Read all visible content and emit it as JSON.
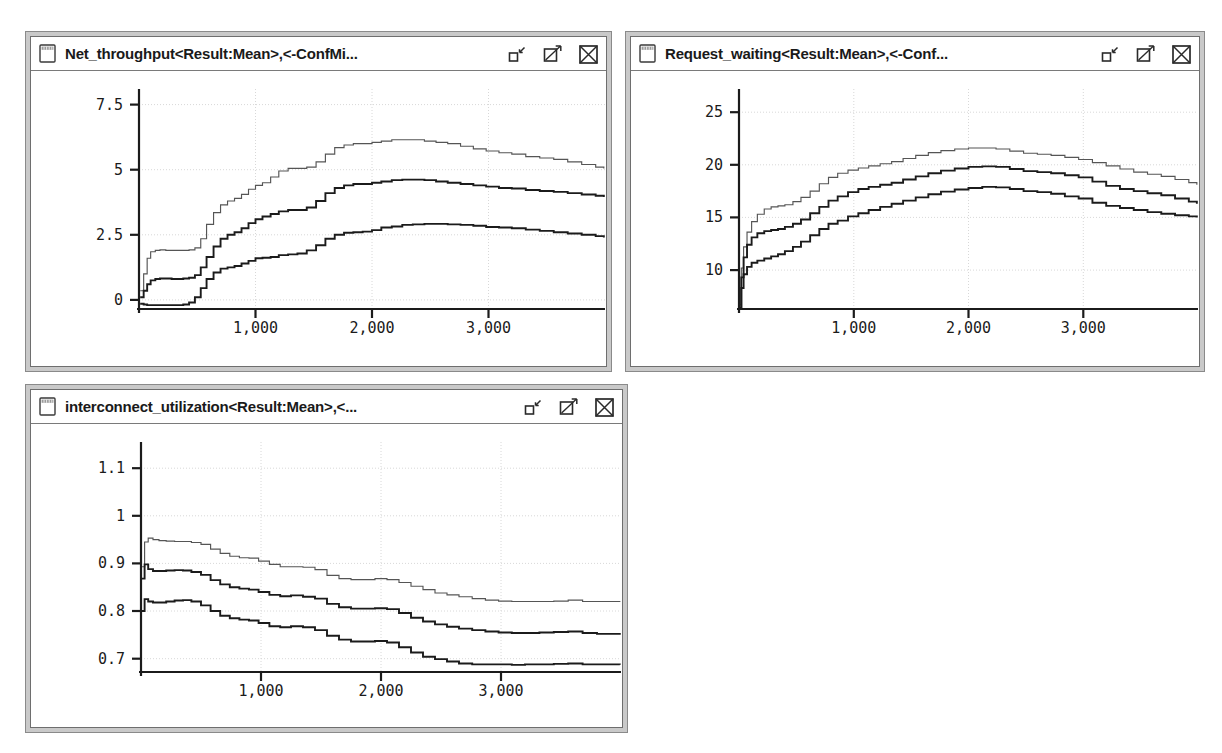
{
  "app": {
    "background": "#ffffff",
    "chrome_color": "#c9c9c9",
    "border_color": "#6e6e6e",
    "line_color": "#1b1b1b",
    "grid_color": "#d8d8d8"
  },
  "windows": [
    {
      "id": "net-throughput",
      "title": "Net_throughput<Result:Mean>,<-ConfMi...",
      "icon": "window-icon",
      "controls": [
        {
          "name": "minimize-button",
          "label": "minimize"
        },
        {
          "name": "maximize-button",
          "label": "maximize"
        },
        {
          "name": "close-button",
          "label": "close"
        }
      ]
    },
    {
      "id": "request-waiting",
      "title": "Request_waiting<Result:Mean>,<-Conf...",
      "icon": "window-icon",
      "controls": [
        {
          "name": "minimize-button",
          "label": "minimize"
        },
        {
          "name": "maximize-button",
          "label": "maximize"
        },
        {
          "name": "close-button",
          "label": "close"
        }
      ]
    },
    {
      "id": "interconnect-utilization",
      "title": "interconnect_utilization<Result:Mean>,<...",
      "icon": "window-icon",
      "controls": [
        {
          "name": "minimize-button",
          "label": "minimize"
        },
        {
          "name": "maximize-button",
          "label": "maximize"
        },
        {
          "name": "close-button",
          "label": "close"
        }
      ]
    }
  ],
  "chart_data": [
    {
      "id": "net-throughput",
      "type": "line",
      "title": "Net_throughput<Result:Mean>,<-ConfMi...",
      "xlabel": "",
      "ylabel": "",
      "grid": true,
      "legend": "none",
      "xlim": [
        0,
        4000
      ],
      "ylim": [
        -0.35,
        8.1
      ],
      "xticks": [
        1000,
        2000,
        3000
      ],
      "xticklabels": [
        "1,000",
        "2,000",
        "3,000"
      ],
      "yticks": [
        0,
        2.5,
        5,
        7.5
      ],
      "yticklabels": [
        "0",
        "2.5",
        "5",
        "7.5"
      ],
      "series": [
        {
          "name": "ConfMax",
          "x": [
            10,
            40,
            70,
            100,
            140,
            180,
            230,
            280,
            330,
            380,
            430,
            480,
            530,
            580,
            640,
            700,
            760,
            820,
            880,
            940,
            1000,
            1060,
            1130,
            1200,
            1280,
            1360,
            1440,
            1520,
            1600,
            1680,
            1760,
            1840,
            1920,
            2000,
            2080,
            2170,
            2260,
            2350,
            2450,
            2550,
            2650,
            2760,
            2870,
            2980,
            3090,
            3200,
            3320,
            3440,
            3560,
            3680,
            3800,
            3920,
            3990
          ],
          "y": [
            0.35,
            1.0,
            1.6,
            1.85,
            1.9,
            1.92,
            1.9,
            1.9,
            1.9,
            1.9,
            1.92,
            2.0,
            2.35,
            2.9,
            3.35,
            3.65,
            3.8,
            3.9,
            4.05,
            4.25,
            4.4,
            4.5,
            4.72,
            4.95,
            5.05,
            5.05,
            5.1,
            5.3,
            5.6,
            5.85,
            5.95,
            6.0,
            6.0,
            6.05,
            6.1,
            6.15,
            6.15,
            6.15,
            6.1,
            6.05,
            6.0,
            5.9,
            5.8,
            5.72,
            5.65,
            5.6,
            5.5,
            5.45,
            5.4,
            5.3,
            5.2,
            5.1,
            5.05
          ]
        },
        {
          "name": "Mean",
          "x": [
            10,
            40,
            70,
            100,
            140,
            180,
            230,
            280,
            330,
            380,
            430,
            480,
            530,
            580,
            640,
            700,
            760,
            820,
            880,
            940,
            1000,
            1060,
            1130,
            1200,
            1280,
            1360,
            1440,
            1520,
            1600,
            1680,
            1760,
            1840,
            1920,
            2000,
            2080,
            2170,
            2260,
            2350,
            2450,
            2550,
            2650,
            2760,
            2870,
            2980,
            3090,
            3200,
            3320,
            3440,
            3560,
            3680,
            3800,
            3920,
            3990
          ],
          "y": [
            0.1,
            0.35,
            0.6,
            0.75,
            0.8,
            0.82,
            0.82,
            0.8,
            0.8,
            0.82,
            0.85,
            0.95,
            1.25,
            1.65,
            2.05,
            2.35,
            2.5,
            2.6,
            2.75,
            2.95,
            3.1,
            3.2,
            3.3,
            3.4,
            3.45,
            3.45,
            3.55,
            3.8,
            4.1,
            4.3,
            4.4,
            4.45,
            4.45,
            4.5,
            4.55,
            4.6,
            4.62,
            4.62,
            4.6,
            4.55,
            4.5,
            4.45,
            4.4,
            4.35,
            4.3,
            4.28,
            4.22,
            4.18,
            4.15,
            4.1,
            4.05,
            4.0,
            3.95
          ]
        },
        {
          "name": "ConfMin",
          "x": [
            10,
            40,
            70,
            100,
            140,
            180,
            230,
            280,
            330,
            380,
            430,
            480,
            530,
            580,
            640,
            700,
            760,
            820,
            880,
            940,
            1000,
            1060,
            1130,
            1200,
            1280,
            1360,
            1440,
            1520,
            1600,
            1680,
            1760,
            1840,
            1920,
            2000,
            2080,
            2170,
            2260,
            2350,
            2450,
            2550,
            2650,
            2760,
            2870,
            2980,
            3090,
            3200,
            3320,
            3440,
            3560,
            3680,
            3800,
            3920,
            3990
          ],
          "y": [
            -0.15,
            -0.18,
            -0.2,
            -0.2,
            -0.2,
            -0.2,
            -0.2,
            -0.2,
            -0.2,
            -0.18,
            -0.1,
            0.1,
            0.45,
            0.8,
            1.05,
            1.2,
            1.25,
            1.3,
            1.4,
            1.5,
            1.6,
            1.62,
            1.65,
            1.72,
            1.75,
            1.78,
            1.9,
            2.1,
            2.35,
            2.5,
            2.58,
            2.6,
            2.62,
            2.68,
            2.78,
            2.82,
            2.88,
            2.9,
            2.92,
            2.92,
            2.9,
            2.88,
            2.85,
            2.8,
            2.78,
            2.75,
            2.7,
            2.65,
            2.6,
            2.55,
            2.5,
            2.45,
            2.4
          ]
        }
      ]
    },
    {
      "id": "request-waiting",
      "type": "line",
      "title": "Request_waiting<Result:Mean>,<-Conf...",
      "xlabel": "",
      "ylabel": "",
      "grid": true,
      "legend": "none",
      "xlim": [
        0,
        4000
      ],
      "ylim": [
        6.3,
        27.2
      ],
      "xticks": [
        1000,
        2000,
        3000
      ],
      "xticklabels": [
        "1,000",
        "2,000",
        "3,000"
      ],
      "yticks": [
        10,
        15,
        20,
        25
      ],
      "yticklabels": [
        "10",
        "15",
        "20",
        "25"
      ],
      "series": [
        {
          "name": "ConfMax",
          "x": [
            8,
            20,
            40,
            70,
            110,
            160,
            220,
            280,
            340,
            400,
            470,
            540,
            620,
            700,
            780,
            860,
            950,
            1040,
            1130,
            1230,
            1330,
            1430,
            1540,
            1650,
            1760,
            1880,
            2000,
            2120,
            2240,
            2360,
            2480,
            2600,
            2720,
            2840,
            2960,
            3080,
            3200,
            3320,
            3440,
            3560,
            3680,
            3800,
            3920,
            3990
          ],
          "y": [
            6.7,
            10.2,
            12.2,
            13.6,
            14.6,
            15.3,
            15.8,
            16.0,
            16.1,
            16.2,
            16.5,
            16.9,
            17.5,
            18.2,
            18.8,
            19.2,
            19.5,
            19.7,
            19.9,
            20.1,
            20.3,
            20.6,
            20.9,
            21.15,
            21.35,
            21.5,
            21.6,
            21.6,
            21.5,
            21.3,
            21.1,
            21.0,
            20.9,
            20.7,
            20.5,
            20.2,
            19.9,
            19.6,
            19.3,
            19.1,
            18.9,
            18.6,
            18.3,
            18.1
          ]
        },
        {
          "name": "Mean",
          "x": [
            8,
            20,
            40,
            70,
            110,
            160,
            220,
            280,
            340,
            400,
            470,
            540,
            620,
            700,
            780,
            860,
            950,
            1040,
            1130,
            1230,
            1330,
            1430,
            1540,
            1650,
            1760,
            1880,
            2000,
            2120,
            2240,
            2360,
            2480,
            2600,
            2720,
            2840,
            2960,
            3080,
            3200,
            3320,
            3440,
            3560,
            3680,
            3800,
            3920,
            3990
          ],
          "y": [
            6.4,
            9.3,
            11.2,
            12.4,
            13.1,
            13.5,
            13.7,
            13.8,
            13.9,
            14.1,
            14.4,
            14.8,
            15.4,
            16.0,
            16.6,
            17.0,
            17.4,
            17.7,
            17.9,
            18.1,
            18.3,
            18.6,
            18.9,
            19.2,
            19.45,
            19.65,
            19.8,
            19.85,
            19.8,
            19.6,
            19.4,
            19.3,
            19.2,
            19.0,
            18.8,
            18.4,
            18.0,
            17.7,
            17.5,
            17.3,
            17.1,
            16.8,
            16.5,
            16.3
          ]
        },
        {
          "name": "ConfMin",
          "x": [
            8,
            20,
            40,
            70,
            110,
            160,
            220,
            280,
            340,
            400,
            470,
            540,
            620,
            700,
            780,
            860,
            950,
            1040,
            1130,
            1230,
            1330,
            1430,
            1540,
            1650,
            1760,
            1880,
            2000,
            2120,
            2240,
            2360,
            2480,
            2600,
            2720,
            2840,
            2960,
            3080,
            3200,
            3320,
            3440,
            3560,
            3680,
            3800,
            3920,
            3990
          ],
          "y": [
            6.3,
            8.3,
            9.6,
            10.3,
            10.7,
            10.9,
            11.1,
            11.3,
            11.5,
            11.8,
            12.2,
            12.7,
            13.3,
            13.9,
            14.4,
            14.7,
            15.1,
            15.4,
            15.7,
            16.0,
            16.3,
            16.6,
            16.9,
            17.2,
            17.45,
            17.65,
            17.8,
            17.9,
            17.85,
            17.7,
            17.5,
            17.4,
            17.25,
            17.0,
            16.8,
            16.4,
            16.1,
            15.9,
            15.7,
            15.5,
            15.35,
            15.2,
            15.1,
            15.0
          ]
        }
      ]
    },
    {
      "id": "interconnect-utilization",
      "type": "line",
      "title": "interconnect_utilization<Result:Mean>,<...",
      "xlabel": "",
      "ylabel": "",
      "grid": true,
      "legend": "none",
      "xlim": [
        0,
        4000
      ],
      "ylim": [
        0.672,
        1.155
      ],
      "xticks": [
        1000,
        2000,
        3000
      ],
      "xticklabels": [
        "1,000",
        "2,000",
        "3,000"
      ],
      "yticks": [
        0.7,
        0.8,
        0.9,
        1,
        1.1
      ],
      "yticklabels": [
        "0.7",
        "0.8",
        "0.9",
        "1",
        "1.1"
      ],
      "series": [
        {
          "name": "ConfMax",
          "x": [
            8,
            30,
            60,
            100,
            150,
            210,
            280,
            350,
            420,
            500,
            580,
            660,
            740,
            820,
            900,
            980,
            1070,
            1160,
            1250,
            1350,
            1450,
            1550,
            1650,
            1750,
            1850,
            1950,
            2050,
            2150,
            2250,
            2350,
            2450,
            2550,
            2650,
            2760,
            2870,
            2980,
            3090,
            3200,
            3320,
            3440,
            3560,
            3680,
            3800,
            3920,
            3990
          ],
          "y": [
            0.893,
            0.945,
            0.953,
            0.95,
            0.948,
            0.947,
            0.946,
            0.946,
            0.944,
            0.94,
            0.93,
            0.921,
            0.915,
            0.912,
            0.911,
            0.905,
            0.898,
            0.893,
            0.893,
            0.892,
            0.887,
            0.875,
            0.868,
            0.866,
            0.866,
            0.868,
            0.866,
            0.86,
            0.852,
            0.845,
            0.838,
            0.834,
            0.83,
            0.826,
            0.823,
            0.821,
            0.82,
            0.82,
            0.82,
            0.821,
            0.823,
            0.82,
            0.82,
            0.82,
            0.819
          ]
        },
        {
          "name": "Mean",
          "x": [
            8,
            30,
            60,
            100,
            150,
            210,
            280,
            350,
            420,
            500,
            580,
            660,
            740,
            820,
            900,
            980,
            1070,
            1160,
            1250,
            1350,
            1450,
            1550,
            1650,
            1750,
            1850,
            1950,
            2050,
            2150,
            2250,
            2350,
            2450,
            2550,
            2650,
            2760,
            2870,
            2980,
            3090,
            3200,
            3320,
            3440,
            3560,
            3680,
            3800,
            3920,
            3990
          ],
          "y": [
            0.868,
            0.898,
            0.888,
            0.884,
            0.884,
            0.885,
            0.886,
            0.885,
            0.882,
            0.876,
            0.865,
            0.856,
            0.85,
            0.847,
            0.845,
            0.84,
            0.834,
            0.831,
            0.833,
            0.83,
            0.826,
            0.815,
            0.808,
            0.805,
            0.805,
            0.806,
            0.804,
            0.796,
            0.786,
            0.778,
            0.772,
            0.767,
            0.763,
            0.76,
            0.757,
            0.755,
            0.754,
            0.754,
            0.755,
            0.756,
            0.757,
            0.754,
            0.752,
            0.752,
            0.75
          ]
        },
        {
          "name": "ConfMin",
          "x": [
            8,
            30,
            60,
            100,
            150,
            210,
            280,
            350,
            420,
            500,
            580,
            660,
            740,
            820,
            900,
            980,
            1070,
            1160,
            1250,
            1350,
            1450,
            1550,
            1650,
            1750,
            1850,
            1950,
            2050,
            2150,
            2250,
            2350,
            2450,
            2550,
            2650,
            2760,
            2870,
            2980,
            3090,
            3200,
            3320,
            3440,
            3560,
            3680,
            3800,
            3920,
            3990
          ],
          "y": [
            0.8,
            0.825,
            0.82,
            0.818,
            0.818,
            0.82,
            0.822,
            0.823,
            0.82,
            0.812,
            0.8,
            0.79,
            0.785,
            0.782,
            0.78,
            0.775,
            0.768,
            0.766,
            0.768,
            0.766,
            0.76,
            0.748,
            0.74,
            0.736,
            0.736,
            0.737,
            0.734,
            0.724,
            0.713,
            0.704,
            0.699,
            0.694,
            0.69,
            0.688,
            0.688,
            0.688,
            0.687,
            0.688,
            0.688,
            0.689,
            0.69,
            0.688,
            0.688,
            0.688,
            0.687
          ]
        }
      ]
    }
  ]
}
